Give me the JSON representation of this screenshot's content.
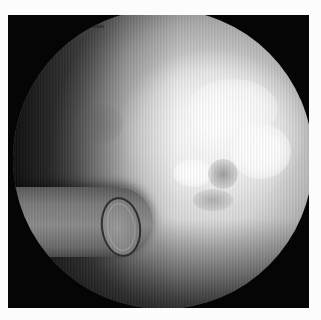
{
  "image": {
    "type": "endoscopic-view",
    "description": "Grayscale circular endoscopic field of view on a black frame with a white border; a tube/catheter tip with a ring opening enters from the left, bright reflective highlights at upper right",
    "colors": {
      "border": "#fcfcfc",
      "frame": "#050505",
      "field_bright": "#ffffff",
      "field_mid": "#d9d9d9",
      "field_dark": "#6a6a6a",
      "tube": "#7b7b7b",
      "tube_ring": "#2d2d2d"
    },
    "overlay_label": {
      "text": ""
    }
  }
}
